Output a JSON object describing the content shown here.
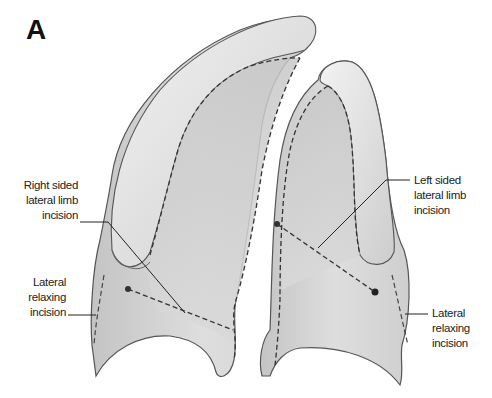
{
  "figure": {
    "panel_letter": "A",
    "colors": {
      "tissue_fill": "#d6d6d6",
      "tissue_light": "#ececec",
      "tissue_shadow": "#a9a9a9",
      "outline": "#555555",
      "incision": "#333333",
      "background": "#ffffff"
    },
    "labels": {
      "right_lateral_limb": {
        "lines": [
          "Right sided",
          "lateral limb",
          "incision"
        ]
      },
      "left_lateral_limb": {
        "lines": [
          "Left sided",
          "lateral limb",
          "incision"
        ]
      },
      "right_relaxing": {
        "lines": [
          "Lateral",
          "relaxing",
          "incision"
        ]
      },
      "left_relaxing": {
        "lines": [
          "Lateral",
          "relaxing",
          "incision"
        ]
      }
    }
  }
}
